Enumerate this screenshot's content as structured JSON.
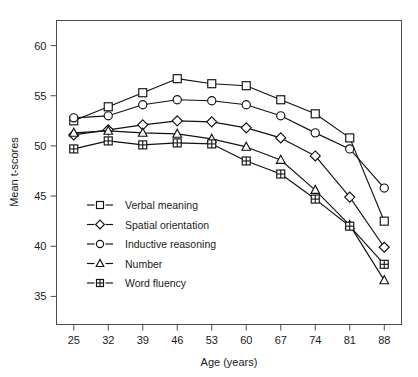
{
  "figure": {
    "background_color": "#ffffff",
    "ink_color": "#111111",
    "axis_color": "#4a4a4a"
  },
  "chart_data": {
    "type": "line",
    "title": "",
    "subtitle": "",
    "xlabel": "Age (years)",
    "ylabel": "Mean t-scores",
    "x": [
      25,
      32,
      39,
      46,
      53,
      60,
      67,
      74,
      81,
      88
    ],
    "categories": [
      "25",
      "32",
      "39",
      "46",
      "53",
      "60",
      "67",
      "74",
      "81",
      "88"
    ],
    "xtick_labels": [
      "25",
      "32",
      "39",
      "46",
      "53",
      "60",
      "67",
      "74",
      "81",
      "88"
    ],
    "ytick_labels": [
      "35",
      "40",
      "45",
      "50",
      "55",
      "60"
    ],
    "yticks": [
      35,
      40,
      45,
      50,
      55,
      60
    ],
    "xlim": [
      21.5,
      91.5
    ],
    "ylim": [
      32.2,
      62.5
    ],
    "grid": false,
    "legend_position": "inside-lower-left",
    "series": [
      {
        "name": "Verbal meaning",
        "marker": "square",
        "values": [
          52.5,
          53.9,
          55.3,
          56.7,
          56.2,
          56.0,
          54.6,
          53.2,
          50.8,
          42.5
        ]
      },
      {
        "name": "Spatial orientation",
        "marker": "diamond",
        "values": [
          51.1,
          51.6,
          52.1,
          52.5,
          52.4,
          51.8,
          50.8,
          49.0,
          44.9,
          39.9
        ]
      },
      {
        "name": "Inductive reasoning",
        "marker": "circle",
        "values": [
          52.8,
          53.0,
          54.1,
          54.6,
          54.5,
          54.1,
          53.0,
          51.3,
          49.7,
          45.8
        ]
      },
      {
        "name": "Number",
        "marker": "triangle",
        "values": [
          51.3,
          51.5,
          51.3,
          51.2,
          50.7,
          49.9,
          48.6,
          45.6,
          42.1,
          36.6
        ]
      },
      {
        "name": "Word fluency",
        "marker": "crossed-square",
        "values": [
          49.7,
          50.5,
          50.1,
          50.3,
          50.2,
          48.5,
          47.2,
          44.7,
          42.0,
          38.2
        ]
      }
    ]
  },
  "legend": {
    "items": [
      {
        "label": "Verbal meaning",
        "marker": "square"
      },
      {
        "label": "Spatial orientation",
        "marker": "diamond"
      },
      {
        "label": "Inductive reasoning",
        "marker": "circle"
      },
      {
        "label": "Number",
        "marker": "triangle"
      },
      {
        "label": "Word fluency",
        "marker": "crossed-square"
      }
    ]
  }
}
